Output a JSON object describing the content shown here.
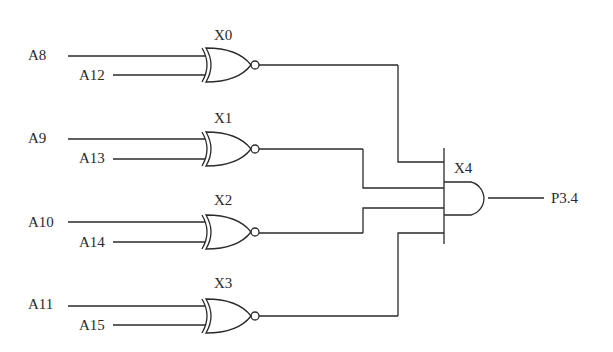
{
  "diagram": {
    "type": "logic-circuit",
    "gates": [
      {
        "id": "X0",
        "label": "X0",
        "kind": "XNOR",
        "inputs": [
          "A8",
          "A12"
        ]
      },
      {
        "id": "X1",
        "label": "X1",
        "kind": "XNOR",
        "inputs": [
          "A9",
          "A13"
        ]
      },
      {
        "id": "X2",
        "label": "X2",
        "kind": "XNOR",
        "inputs": [
          "A10",
          "A14"
        ]
      },
      {
        "id": "X3",
        "label": "X3",
        "kind": "XNOR",
        "inputs": [
          "A11",
          "A15"
        ]
      },
      {
        "id": "X4",
        "label": "X4",
        "kind": "AND",
        "inputs": [
          "X0",
          "X1",
          "X2",
          "X3"
        ],
        "output": "P3.4"
      }
    ],
    "output_label": "P3.4"
  }
}
